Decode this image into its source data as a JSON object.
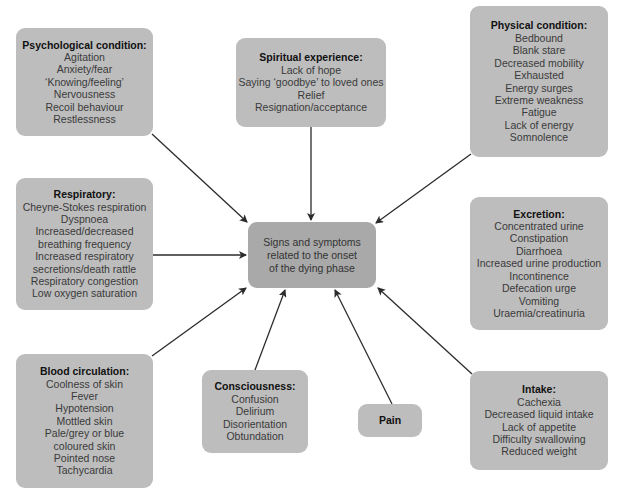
{
  "center": {
    "lines": [
      "Signs and symptoms",
      "related to the onset",
      "of the dying phase"
    ]
  },
  "categories": {
    "psychological": {
      "title": "Psychological condition:",
      "items": [
        "Agitation",
        "Anxiety/fear",
        "‘Knowing/feeling’",
        "Nervousness",
        "Recoil behaviour",
        "Restlessness"
      ]
    },
    "spiritual": {
      "title": "Spiritual experience:",
      "items": [
        "Lack of hope",
        "Saying ‘goodbye’ to loved ones",
        "Relief",
        "Resignation/acceptance"
      ]
    },
    "physical": {
      "title": "Physical condition:",
      "items": [
        "Bedbound",
        "Blank stare",
        "Decreased mobility",
        "Exhausted",
        "Energy surges",
        "Extreme weakness",
        "Fatigue",
        "Lack of energy",
        "Somnolence"
      ]
    },
    "respiratory": {
      "title": "Respiratory:",
      "items": [
        "Cheyne-Stokes respiration",
        "Dyspnoea",
        "Increased/decreased",
        "breathing frequency",
        "Increased respiratory",
        "secretions/death rattle",
        "Respiratory congestion",
        "Low oxygen saturation"
      ]
    },
    "excretion": {
      "title": "Excretion:",
      "items": [
        "Concentrated urine",
        "Constipation",
        "Diarrhoea",
        "Increased urine production",
        "Incontinence",
        "Defecation urge",
        "Vomiting",
        "Uraemia/creatinuria"
      ]
    },
    "blood": {
      "title": "Blood circulation:",
      "items": [
        "Coolness of skin",
        "Fever",
        "Hypotension",
        "Mottled skin",
        "Pale/grey or blue",
        "coloured skin",
        "Pointed nose",
        "Tachycardia"
      ]
    },
    "consciousness": {
      "title": "Consciousness:",
      "items": [
        "Confusion",
        "Delirium",
        "Disorientation",
        "Obtundation"
      ]
    },
    "pain": {
      "title": "Pain",
      "items": []
    },
    "intake": {
      "title": "Intake:",
      "items": [
        "Cachexia",
        "Decreased liquid intake",
        "Lack of appetite",
        "Difficulty swallowing",
        "Reduced weight"
      ]
    }
  },
  "colors": {
    "box": "#bdbdbd",
    "center_box": "#a9a9a9",
    "arrow": "#2b2b2b"
  }
}
